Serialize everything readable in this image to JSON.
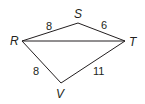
{
  "diagram": {
    "type": "quadrilateral-with-diagonal",
    "vertices": [
      {
        "id": "R",
        "label": "R",
        "x": 22,
        "y": 41,
        "lx": 14,
        "ly": 45
      },
      {
        "id": "S",
        "label": "S",
        "x": 78,
        "y": 23,
        "lx": 75,
        "ly": 18
      },
      {
        "id": "T",
        "label": "T",
        "x": 125,
        "y": 41,
        "lx": 129,
        "ly": 46
      },
      {
        "id": "V",
        "label": "V",
        "x": 61,
        "y": 83,
        "lx": 57,
        "ly": 97
      }
    ],
    "edges": [
      {
        "from": "R",
        "to": "S",
        "length_label": "8",
        "lx": 47,
        "ly": 29
      },
      {
        "from": "S",
        "to": "T",
        "length_label": "6",
        "lx": 101,
        "ly": 29
      },
      {
        "from": "R",
        "to": "T",
        "length_label": "",
        "lx": 0,
        "ly": 0
      },
      {
        "from": "R",
        "to": "V",
        "length_label": "8",
        "lx": 33,
        "ly": 74
      },
      {
        "from": "V",
        "to": "T",
        "length_label": "11",
        "lx": 94,
        "ly": 74
      }
    ],
    "stroke_color": "#231f20"
  }
}
